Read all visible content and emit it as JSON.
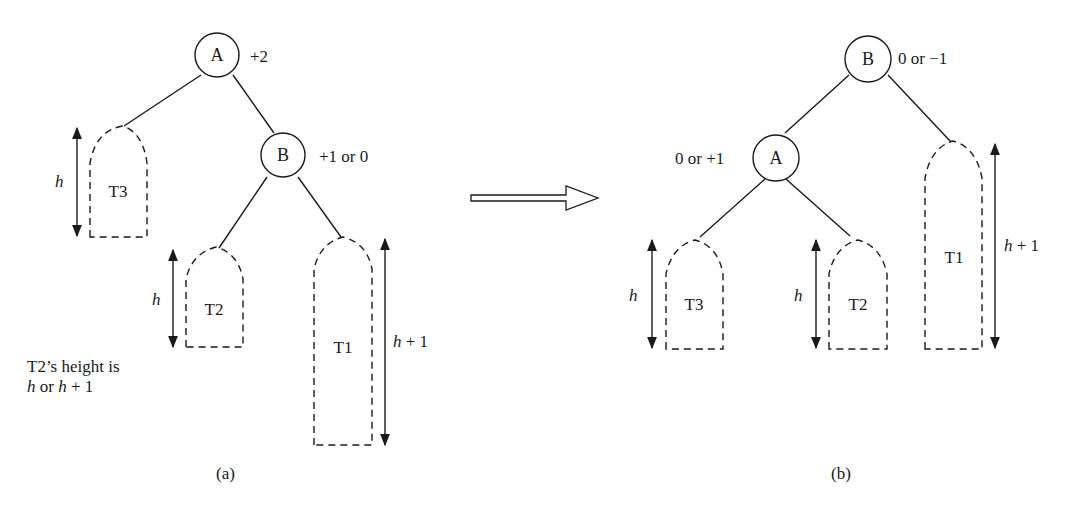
{
  "diagram": {
    "type": "AVL tree single rotation (RR case)",
    "panel_a": {
      "caption": "(a)",
      "nodes": [
        {
          "id": "A",
          "label": "A",
          "balance": "+2"
        },
        {
          "id": "B",
          "label": "B",
          "balance": "+1 or 0"
        }
      ],
      "subtrees": [
        {
          "label": "T3",
          "height": "h"
        },
        {
          "label": "T2",
          "height": "h"
        },
        {
          "label": "T1",
          "height": "h + 1"
        }
      ],
      "note_line1": "T2’s height is",
      "note_line2_h1": "h",
      "note_line2_or": " or ",
      "note_line2_h2": "h",
      "note_line2_rest": " + 1"
    },
    "arrow": "transforms-to",
    "panel_b": {
      "caption": "(b)",
      "nodes": [
        {
          "id": "B",
          "label": "B",
          "balance": "0 or −1"
        },
        {
          "id": "A",
          "label": "A",
          "balance": "0 or +1"
        }
      ],
      "subtrees": [
        {
          "label": "T3",
          "height": "h"
        },
        {
          "label": "T2",
          "height": "h"
        },
        {
          "label": "T1",
          "height": "h + 1"
        }
      ]
    },
    "height_var": "h",
    "height_plus": " + 1"
  }
}
